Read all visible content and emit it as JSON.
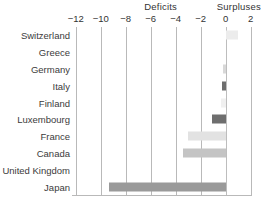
{
  "header": {
    "deficits_label": "Deficits",
    "surpluses_label": "Surpluses"
  },
  "chart_data": {
    "type": "bar",
    "orientation": "horizontal",
    "title": "",
    "subtitle": "",
    "xlabel": "",
    "ylabel": "",
    "xlim": [
      -13,
      2.6
    ],
    "grid": true,
    "legend": "none",
    "annotations": [
      "Deficits",
      "Surpluses"
    ],
    "xticks": [
      -12,
      -10,
      -8,
      -6,
      -4,
      -2,
      0,
      2
    ],
    "xticklabels": [
      "−12",
      "−10",
      "−8",
      "−6",
      "−4",
      "−2",
      "0",
      "2"
    ],
    "categories": [
      "Switzerland",
      "Greece",
      "Germany",
      "Italy",
      "Finland",
      "Luxembourg",
      "France",
      "Canada",
      "United Kingdom",
      "Japan"
    ],
    "values": [
      1.0,
      0.0,
      -0.2,
      -0.3,
      -0.4,
      -1.1,
      -3.0,
      -3.4,
      0.0,
      -9.3
    ],
    "bar_colors": [
      "#ececec",
      "#ffffff",
      "#d8d8d8",
      "#6e6e6e",
      "#f0f0f0",
      "#6e6e6e",
      "#e2e2e2",
      "#c4c4c4",
      "#ffffff",
      "#9a9a9a"
    ]
  },
  "colors": {
    "gridline": "#b9b9b9",
    "text": "#3a3a3a",
    "background": "#ffffff"
  }
}
